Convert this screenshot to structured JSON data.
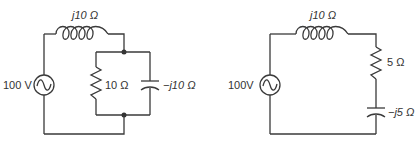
{
  "circuits": [
    {
      "id": "left",
      "source": {
        "label": "100 V",
        "type": "ac-voltage-source"
      },
      "inductor": {
        "label": "j10 Ω"
      },
      "resistor": {
        "label": "10 Ω"
      },
      "capacitor": {
        "label": "−j10 Ω"
      },
      "topology": "series inductor feeding parallel R‖C"
    },
    {
      "id": "right",
      "source": {
        "label": "100V",
        "type": "ac-voltage-source"
      },
      "inductor": {
        "label": "j10 Ω"
      },
      "resistor": {
        "label": "5 Ω"
      },
      "capacitor": {
        "label": "−j5 Ω"
      },
      "topology": "series L-R-C"
    }
  ],
  "colors": {
    "line": "#3a3a3a",
    "text": "#333333",
    "background": "#ffffff"
  }
}
